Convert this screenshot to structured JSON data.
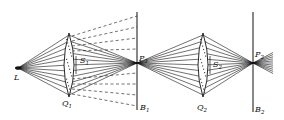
{
  "diagram": {
    "type": "optical ray diagram",
    "colors": {
      "ink": "#111111",
      "background": "#ffffff"
    },
    "source": {
      "label": "L",
      "x": 18,
      "y": 68
    },
    "lenses": [
      {
        "id": "Q1",
        "label": "Q",
        "sub": "1",
        "x": 69,
        "top": 33,
        "bottom": 97,
        "aperture_label": "S",
        "aperture_sub": "1"
      },
      {
        "id": "Q2",
        "label": "Q",
        "sub": "2",
        "x": 203,
        "top": 33,
        "bottom": 97,
        "aperture_label": "S",
        "aperture_sub": "2"
      }
    ],
    "screens": [
      {
        "id": "B1",
        "label": "B",
        "sub": "1",
        "x": 137,
        "top": 12,
        "bottom": 110,
        "focus_label": "P",
        "focus_sub": "1"
      },
      {
        "id": "B2",
        "label": "B",
        "sub": "2",
        "x": 253,
        "top": 12,
        "bottom": 112,
        "focus_label": "P",
        "focus_sub": "2"
      }
    ]
  }
}
